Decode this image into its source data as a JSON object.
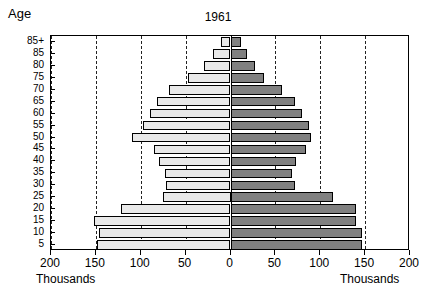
{
  "chart_data": {
    "type": "bar",
    "subtype": "population-pyramid",
    "title": "1961",
    "xlabel": "Thousands",
    "ylabel": "Age",
    "xlabel_left": "Thousands",
    "xlabel_right": "Thousands",
    "grid": true,
    "legend": "none",
    "xlim": [
      -200,
      200
    ],
    "xticks": [
      -200,
      -150,
      -100,
      -50,
      0,
      50,
      100,
      150,
      200
    ],
    "xtick_labels": [
      "200",
      "150",
      "100",
      "50",
      "0",
      "50",
      "100",
      "150",
      "200"
    ],
    "categories": [
      "5",
      "10",
      "15",
      "20",
      "25",
      "30",
      "35",
      "40",
      "45",
      "50",
      "55",
      "60",
      "65",
      "70",
      "75",
      "80",
      "85",
      "85+"
    ],
    "series": [
      {
        "name": "male",
        "side": "left",
        "color": "#e9e9e9",
        "values": [
          149,
          146,
          152,
          122,
          75,
          72,
          73,
          80,
          85,
          110,
          98,
          90,
          82,
          68,
          47,
          30,
          20,
          11
        ]
      },
      {
        "name": "female",
        "side": "right",
        "color": "#808080",
        "values": [
          147,
          147,
          140,
          140,
          114,
          72,
          68,
          73,
          84,
          90,
          88,
          80,
          72,
          57,
          37,
          27,
          18,
          12
        ]
      }
    ]
  },
  "axis": {
    "age_title": "Age",
    "unit_left": "Thousands",
    "unit_right": "Thousands"
  }
}
